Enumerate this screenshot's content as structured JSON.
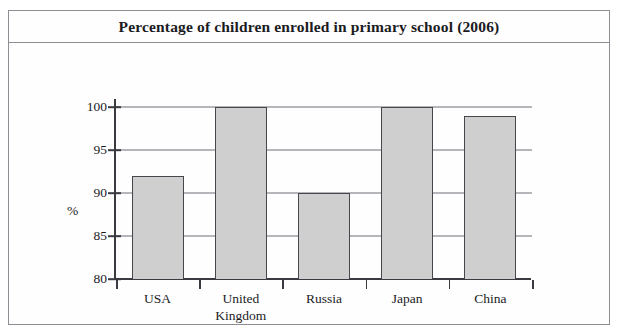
{
  "chart_data": {
    "type": "bar",
    "title": "Percentage of children enrolled in primary school (2006)",
    "xlabel": "",
    "ylabel": "%",
    "categories": [
      "USA",
      "United\nKingdom",
      "Russia",
      "Japan",
      "China"
    ],
    "values": [
      92,
      100,
      90,
      100,
      99
    ],
    "ylim": [
      80,
      100
    ],
    "yticks": [
      80,
      85,
      90,
      95,
      100
    ],
    "ytick_labels": [
      "80",
      "85",
      "90",
      "95",
      "100"
    ],
    "grid": true,
    "legend": false,
    "bar_fill_color": "#cfcfcf",
    "bar_edge_color": "#46464c",
    "axis_color": "#3a3a40",
    "grid_color": "#6f6f76",
    "background_color": "#fefefe",
    "frame_color": "#8d8d93",
    "text_color": "#1b1b1f"
  }
}
